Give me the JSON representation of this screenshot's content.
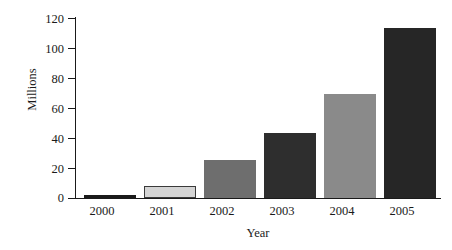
{
  "chart_data": {
    "type": "bar",
    "title": "",
    "xlabel": "Year",
    "ylabel": "Millions",
    "categories": [
      "2000",
      "2001",
      "2002",
      "2003",
      "2004",
      "2005"
    ],
    "values": [
      2,
      8,
      25,
      43,
      69,
      113
    ],
    "ylim": [
      0,
      120
    ],
    "yticks": [
      0,
      20,
      40,
      60,
      80,
      100,
      120
    ],
    "ytick_labels": [
      "0",
      "20",
      "40",
      "60",
      "80",
      "100",
      "120"
    ],
    "grid": false,
    "legend": null,
    "bar_colors": [
      "#1a1a1a",
      "#d4d4d4",
      "#6e6e6e",
      "#2e2e2e",
      "#8a8a8a",
      "#262626"
    ],
    "series": [
      {
        "name": "Millions",
        "values": [
          2,
          8,
          25,
          43,
          69,
          113
        ]
      }
    ]
  },
  "axes": {
    "y_title": "Millions",
    "x_title": "Year",
    "tick_0": "0",
    "tick_20": "20",
    "tick_40": "40",
    "tick_60": "60",
    "tick_80": "80",
    "tick_100": "100",
    "tick_120": "120"
  },
  "x_labels": {
    "c0": "2000",
    "c1": "2001",
    "c2": "2002",
    "c3": "2003",
    "c4": "2004",
    "c5": "2005"
  }
}
